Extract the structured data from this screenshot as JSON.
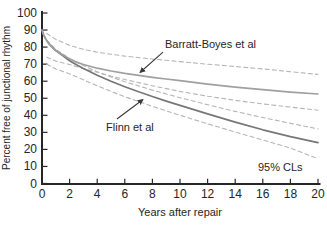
{
  "chart_data": {
    "type": "line",
    "title": "",
    "xlabel": "Years after repair",
    "ylabel": "Percent free of junctional rhythm",
    "xlim": [
      0,
      20
    ],
    "ylim": [
      0,
      100
    ],
    "xticks": [
      0,
      2,
      4,
      6,
      8,
      10,
      12,
      14,
      16,
      18,
      20
    ],
    "yticks": [
      0,
      10,
      20,
      30,
      40,
      50,
      60,
      70,
      80,
      90,
      100
    ],
    "grid": false,
    "legend_position": "none (direct curve labels with leader arrows)",
    "series": [
      {
        "id": "flinn-lower-cl",
        "name": "Flinn et al lower 95% CL",
        "style": "dashed",
        "color": "#b5b5b5",
        "points": [
          [
            0.35,
            70
          ],
          [
            1,
            67.2
          ],
          [
            2,
            64.3
          ],
          [
            3,
            60.8
          ],
          [
            4,
            57.3
          ],
          [
            5,
            54
          ],
          [
            6,
            50.9
          ],
          [
            8,
            45.3
          ],
          [
            10,
            40
          ],
          [
            12,
            35
          ],
          [
            14,
            30.2
          ],
          [
            16,
            25.5
          ],
          [
            18,
            20.8
          ],
          [
            20,
            14.5
          ]
        ]
      },
      {
        "id": "flinn-upper-cl",
        "name": "Flinn et al upper 95% CL",
        "style": "dashed",
        "color": "#b5b5b5",
        "points": [
          [
            0.35,
            84
          ],
          [
            1,
            78.6
          ],
          [
            2,
            73.4
          ],
          [
            3,
            69.2
          ],
          [
            4,
            65.6
          ],
          [
            5,
            62.5
          ],
          [
            6,
            59.7
          ],
          [
            8,
            54.8
          ],
          [
            10,
            50.3
          ],
          [
            12,
            46.2
          ],
          [
            14,
            42.3
          ],
          [
            16,
            38.7
          ],
          [
            18,
            35.3
          ],
          [
            20,
            32
          ]
        ]
      },
      {
        "id": "barratt-boyes-lower-cl",
        "name": "Barratt-Boyes et al lower 95% CL",
        "style": "dashed",
        "color": "#b5b5b5",
        "points": [
          [
            0.35,
            74
          ],
          [
            1,
            71.8
          ],
          [
            2,
            69.8
          ],
          [
            3,
            67.4
          ],
          [
            4,
            65.2
          ],
          [
            5,
            63
          ],
          [
            6,
            61
          ],
          [
            8,
            57.3
          ],
          [
            10,
            54
          ],
          [
            12,
            51.2
          ],
          [
            14,
            48.8
          ],
          [
            16,
            46.7
          ],
          [
            18,
            44.8
          ],
          [
            20,
            43
          ]
        ]
      },
      {
        "id": "barratt-boyes-upper-cl",
        "name": "Barratt-Boyes et al upper 95% CL",
        "style": "dashed",
        "color": "#b5b5b5",
        "points": [
          [
            0.35,
            88
          ],
          [
            1,
            84.5
          ],
          [
            2,
            81
          ],
          [
            3,
            78.7
          ],
          [
            4,
            77
          ],
          [
            5,
            75.8
          ],
          [
            6,
            74.7
          ],
          [
            8,
            73
          ],
          [
            10,
            71.5
          ],
          [
            12,
            70
          ],
          [
            14,
            68.6
          ],
          [
            16,
            67.2
          ],
          [
            18,
            65.6
          ],
          [
            20,
            64
          ]
        ]
      },
      {
        "id": "flinn",
        "name": "Flinn et al",
        "style": "solid",
        "color": "#777777",
        "points": [
          [
            0,
            90
          ],
          [
            0.1,
            87.5
          ],
          [
            0.25,
            85
          ],
          [
            0.5,
            82
          ],
          [
            0.75,
            79.8
          ],
          [
            1,
            78
          ],
          [
            1.5,
            75
          ],
          [
            2,
            72
          ],
          [
            2.5,
            69.6
          ],
          [
            3,
            67.5
          ],
          [
            4,
            63.5
          ],
          [
            5,
            60
          ],
          [
            6,
            56.8
          ],
          [
            7,
            53.8
          ],
          [
            8,
            51
          ],
          [
            9,
            48.3
          ],
          [
            10,
            45.8
          ],
          [
            12,
            40.8
          ],
          [
            14,
            36
          ],
          [
            16,
            31.5
          ],
          [
            18,
            27.5
          ],
          [
            20,
            24
          ]
        ]
      },
      {
        "id": "barratt-boyes",
        "name": "Barratt-Boyes et al",
        "style": "solid",
        "color": "#a0a0a0",
        "points": [
          [
            0,
            90
          ],
          [
            0.1,
            87.5
          ],
          [
            0.25,
            85
          ],
          [
            0.5,
            82
          ],
          [
            0.75,
            79.8
          ],
          [
            1,
            78
          ],
          [
            1.5,
            75.5
          ],
          [
            2,
            73
          ],
          [
            2.5,
            71.2
          ],
          [
            3,
            69.8
          ],
          [
            4,
            67.6
          ],
          [
            5,
            66
          ],
          [
            6,
            64.6
          ],
          [
            7,
            63.4
          ],
          [
            8,
            62.3
          ],
          [
            9,
            61.3
          ],
          [
            10,
            60.3
          ],
          [
            12,
            58.3
          ],
          [
            14,
            56.5
          ],
          [
            16,
            55
          ],
          [
            18,
            53.6
          ],
          [
            20,
            52.5
          ]
        ]
      }
    ],
    "annotations": [
      {
        "id": "barratt-boyes-label",
        "text": "Barratt-Boyes et al",
        "x": 8.91,
        "y": 79.5,
        "anchor": "start",
        "arrow": {
          "x1": 8.77,
          "y1": 77.1,
          "x2": 7.1,
          "y2": 65.1
        }
      },
      {
        "id": "flinn-label",
        "text": "Flinn et al",
        "x": 4.64,
        "y": 30.8,
        "anchor": "start",
        "arrow": {
          "x1": 5.43,
          "y1": 37.8,
          "x2": 7.32,
          "y2": 49.3
        }
      },
      {
        "id": "cls-label",
        "text": "95% CLs",
        "x": 15.65,
        "y": 7.3,
        "anchor": "start"
      }
    ]
  },
  "colors": {
    "background": "#ffffff",
    "axis": "#262626",
    "text": "#262626",
    "annotation_arrow": "#3a3a3a"
  }
}
